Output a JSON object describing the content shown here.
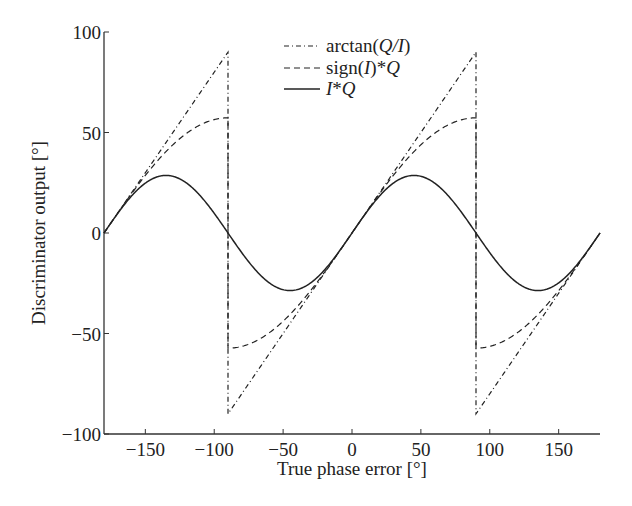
{
  "chart_data": {
    "type": "line",
    "title": "",
    "xlabel": "True phase error [°]",
    "ylabel": "Discriminator output [°]",
    "xlim": [
      -180,
      180
    ],
    "ylim": [
      -100,
      100
    ],
    "xticks": [
      -150,
      -100,
      -50,
      0,
      50,
      100,
      150
    ],
    "yticks": [
      -100,
      -50,
      0,
      50,
      100
    ],
    "xtick_labels": [
      "−150",
      "−100",
      "−50",
      "0",
      "50",
      "100",
      "150"
    ],
    "ytick_labels": [
      "−100",
      "−50",
      "0",
      "50",
      "100"
    ],
    "grid": false,
    "legend_position": "upper center",
    "x": [
      -180,
      -150,
      -135,
      -120,
      -90,
      -89.9,
      -60,
      -45,
      -30,
      0,
      30,
      45,
      60,
      90,
      90.1,
      120,
      135,
      150,
      180
    ],
    "series": [
      {
        "name": "arctan(Q/I)",
        "style": "dash-dot",
        "description": "Sawtooth: equals phase error wrapped to (-90, 90]; jumps from +90 to -90 at ±90°",
        "values": [
          0,
          30,
          45,
          60,
          90,
          -90,
          -60,
          -45,
          -30,
          0,
          30,
          45,
          60,
          90,
          -90,
          -60,
          -45,
          -30,
          0
        ]
      },
      {
        "name": "sign(I)*Q",
        "style": "dashed",
        "description": "(180/π)·|sin(e)|-like shape: 57.3·sin(e)·sign(cos(e)); peaks at ±57.3 near ±90°",
        "values": [
          0,
          28.6,
          40.5,
          49.6,
          57.3,
          -57.3,
          -49.6,
          -40.5,
          -28.6,
          0,
          28.6,
          40.5,
          49.6,
          57.3,
          -57.3,
          -49.6,
          -40.5,
          -28.6,
          0
        ]
      },
      {
        "name": "I*Q",
        "style": "solid",
        "description": "28.65·sin(2e); peaks ±28.65 at ±45°, ±135°",
        "values": [
          0,
          24.8,
          28.6,
          24.8,
          0,
          0,
          -24.8,
          -28.6,
          -24.8,
          0,
          24.8,
          28.6,
          24.8,
          0,
          0,
          -24.8,
          -28.6,
          -24.8,
          0
        ]
      }
    ]
  },
  "legend": {
    "items": [
      {
        "label_prefix": "arctan(",
        "label_italic": "Q/I",
        "label_suffix": ")",
        "style": "dash-dot"
      },
      {
        "label_prefix": "sign(",
        "label_italic": "I",
        "label_suffix": ")*",
        "label_italic2": "Q",
        "style": "dashed"
      },
      {
        "label_italic": "I",
        "label_suffix": "*",
        "label_italic2": "Q",
        "style": "solid"
      }
    ]
  },
  "colors": {
    "line": "#222222",
    "axis": "#333333",
    "background": "#ffffff"
  }
}
